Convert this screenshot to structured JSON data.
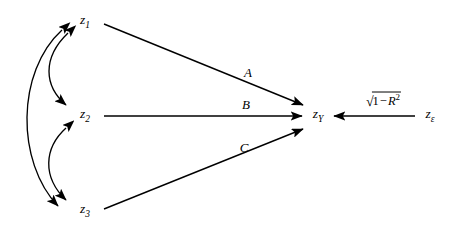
{
  "diagram": {
    "type": "path-diagram",
    "background_color": "#ffffff",
    "stroke_color": "#000000",
    "nodes": [
      {
        "id": "z1",
        "base": "z",
        "subscript": "1",
        "x": 85,
        "y": 22
      },
      {
        "id": "z2",
        "base": "z",
        "subscript": "2",
        "x": 85,
        "y": 116
      },
      {
        "id": "z3",
        "base": "z",
        "subscript": "3",
        "x": 85,
        "y": 211
      },
      {
        "id": "zY",
        "base": "z",
        "subscript": "Y",
        "x": 318,
        "y": 116
      },
      {
        "id": "zE",
        "base": "z",
        "subscript": "ε",
        "x": 430,
        "y": 116
      }
    ],
    "path_arrows": [
      {
        "id": "a-path",
        "from": "z1",
        "to": "zY",
        "label": "A",
        "label_x": 248,
        "label_y": 72
      },
      {
        "id": "b-path",
        "from": "z2",
        "to": "zY",
        "label": "B",
        "label_x": 246,
        "label_y": 104
      },
      {
        "id": "c-path",
        "from": "z3",
        "to": "zY",
        "label": "C",
        "label_x": 244,
        "label_y": 147
      }
    ],
    "correlation_arrows": [
      {
        "id": "corr-z1-z2",
        "from": "z1",
        "to": "z2",
        "style": "double-headed-curved"
      },
      {
        "id": "corr-z2-z3",
        "from": "z2",
        "to": "z3",
        "style": "double-headed-curved"
      },
      {
        "id": "corr-z1-z3",
        "from": "z1",
        "to": "z3",
        "style": "double-headed-curved"
      }
    ],
    "residual_arrow": {
      "id": "residual-path",
      "from": "zE",
      "to": "zY",
      "direction": "leftward",
      "label_x": 383,
      "label_y": 100,
      "label_parts": {
        "radical": "√",
        "one": "1",
        "minus": "−",
        "r": "R",
        "exponent": "2"
      },
      "label_plain": "√(1 − R²)"
    }
  }
}
